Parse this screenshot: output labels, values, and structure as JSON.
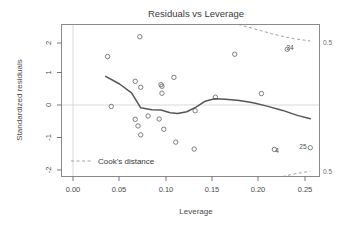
{
  "chart_data": {
    "type": "scatter",
    "title": "Residuals vs Leverage",
    "xlabel": "Leverage",
    "ylabel": "Standardized residuals",
    "xlim": [
      -0.008,
      0.272
    ],
    "ylim": [
      -2.18,
      2.42
    ],
    "xticks": [
      0.0,
      0.05,
      0.1,
      0.15,
      0.2,
      0.25
    ],
    "xtick_labels": [
      "0.00",
      "0.05",
      "0.10",
      "0.15",
      "0.20",
      "0.25"
    ],
    "yticks": [
      2,
      1,
      0,
      -1,
      -2
    ],
    "ytick_labels": [
      "2",
      "1",
      "0",
      "-1",
      "-2"
    ],
    "grid": false,
    "reference_lines": [
      {
        "orientation": "horizontal",
        "value": 0,
        "style": "dotted",
        "color": "#cfcfcf"
      },
      {
        "orientation": "vertical",
        "value": 0,
        "style": "dotted",
        "color": "#cfcfcf"
      }
    ],
    "points": [
      {
        "x": 0.042,
        "y": 1.45,
        "label": ""
      },
      {
        "x": 0.046,
        "y": -0.06,
        "label": ""
      },
      {
        "x": 0.072,
        "y": 0.7,
        "label": ""
      },
      {
        "x": 0.072,
        "y": -0.45,
        "label": ""
      },
      {
        "x": 0.075,
        "y": -0.65,
        "label": ""
      },
      {
        "x": 0.077,
        "y": 2.05,
        "label": ""
      },
      {
        "x": 0.078,
        "y": 0.52,
        "label": ""
      },
      {
        "x": 0.078,
        "y": -0.92,
        "label": ""
      },
      {
        "x": 0.086,
        "y": -0.35,
        "label": ""
      },
      {
        "x": 0.098,
        "y": -0.44,
        "label": ""
      },
      {
        "x": 0.1,
        "y": 0.6,
        "label": ""
      },
      {
        "x": 0.101,
        "y": 0.55,
        "label": ""
      },
      {
        "x": 0.101,
        "y": 0.34,
        "label": ""
      },
      {
        "x": 0.103,
        "y": -0.75,
        "label": ""
      },
      {
        "x": 0.114,
        "y": 0.82,
        "label": ""
      },
      {
        "x": 0.116,
        "y": -1.14,
        "label": ""
      },
      {
        "x": 0.136,
        "y": -1.35,
        "label": ""
      },
      {
        "x": 0.137,
        "y": -0.19,
        "label": ""
      },
      {
        "x": 0.159,
        "y": 0.22,
        "label": ""
      },
      {
        "x": 0.18,
        "y": 1.52,
        "label": ""
      },
      {
        "x": 0.209,
        "y": 0.33,
        "label": ""
      },
      {
        "x": 0.223,
        "y": -1.36,
        "label": "4"
      },
      {
        "x": 0.237,
        "y": 1.67,
        "label": "24"
      },
      {
        "x": 0.262,
        "y": -1.31,
        "label": "25"
      }
    ],
    "point_labels": [
      {
        "text": "24",
        "x": 0.24,
        "y": 1.64
      },
      {
        "text": "4",
        "x": 0.226,
        "y": -1.46
      },
      {
        "text": "25",
        "x": 0.254,
        "y": -1.36
      }
    ],
    "smooth_curve": {
      "name": "loess smooth",
      "x": [
        0.04,
        0.055,
        0.068,
        0.078,
        0.09,
        0.1,
        0.11,
        0.118,
        0.128,
        0.138,
        0.148,
        0.158,
        0.17,
        0.185,
        0.2,
        0.215,
        0.232,
        0.248,
        0.262
      ],
      "y": [
        0.85,
        0.62,
        0.35,
        -0.1,
        -0.16,
        -0.17,
        -0.25,
        -0.27,
        -0.22,
        -0.08,
        0.1,
        0.17,
        0.16,
        0.12,
        0.05,
        -0.05,
        -0.18,
        -0.33,
        -0.43
      ]
    },
    "cooks_contours": [
      {
        "level": "0.5",
        "label": "0.5",
        "branch": "upper",
        "x": [
          0.184,
          0.2,
          0.22,
          0.24,
          0.262
        ],
        "y": [
          2.42,
          2.3,
          2.14,
          2.01,
          1.92
        ]
      },
      {
        "level": "0.5",
        "label": "0.5",
        "branch": "lower",
        "x": [
          0.232,
          0.245,
          0.262
        ],
        "y": [
          -2.18,
          -2.1,
          -2.02
        ]
      }
    ],
    "contour_labels": [
      {
        "text": "0.5",
        "position": "top-right"
      },
      {
        "text": "0.5",
        "position": "bottom-right"
      }
    ],
    "legend": {
      "position": "bottom-left",
      "entries": [
        {
          "label": "Cook's distance",
          "style": "dashed",
          "color": "#8a8a8a"
        }
      ]
    }
  },
  "colors": {
    "frame": "#8a8a8a",
    "point": "#707070",
    "smooth": "#555555",
    "cook": "#8a8a8a",
    "reference": "#cfcfcf",
    "text": "#3a3a3a",
    "background": "#ffffff"
  }
}
